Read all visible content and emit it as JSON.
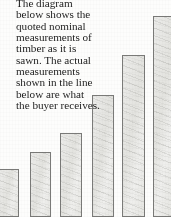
{
  "caption": {
    "lines": [
      "The diagram",
      "below shows the",
      "quoted nominal",
      "measurements of",
      "timber as it is",
      "sawn. The actual",
      "measurements",
      "shown in the line",
      "below are what",
      "the buyer receives."
    ],
    "text": "The diagram below shows the quoted nominal measurements of timber as it is sawn. The actual measurements shown in the line below are what the buyer receives."
  },
  "colors": {
    "page_background": "#fdfdfc",
    "bar_fill": "#e9e9e6",
    "bar_outline": "#7a7a78",
    "text": "#1d1d1d"
  },
  "chart_data": {
    "type": "bar",
    "title": "",
    "subtitle": "",
    "xlabel": "",
    "ylabel": "",
    "grid": false,
    "legend": null,
    "axis_visible": false,
    "note": "Bars represent quoted nominal timber sizes, increasing left to right; leftmost and rightmost bars are cropped by the image edges.",
    "categories": [
      "1",
      "2",
      "3",
      "4",
      "5",
      "6"
    ],
    "values": [
      48,
      65,
      84,
      122,
      162,
      201
    ],
    "ylim": [
      0,
      217
    ],
    "bars": [
      {
        "label": "1",
        "value": 48,
        "x": 0,
        "width": 19,
        "top": 169,
        "clipped": "left"
      },
      {
        "label": "2",
        "value": 65,
        "x": 30,
        "width": 21,
        "top": 152,
        "clipped": "none"
      },
      {
        "label": "3",
        "value": 84,
        "x": 60,
        "width": 22,
        "top": 133,
        "clipped": "none"
      },
      {
        "label": "4",
        "value": 122,
        "x": 92,
        "width": 22,
        "top": 95,
        "clipped": "none"
      },
      {
        "label": "5",
        "value": 162,
        "x": 122,
        "width": 23,
        "top": 55,
        "clipped": "none"
      },
      {
        "label": "6",
        "value": 201,
        "x": 153,
        "width": 18,
        "top": 16,
        "clipped": "right"
      }
    ]
  }
}
